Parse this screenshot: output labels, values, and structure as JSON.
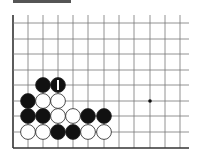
{
  "board": {
    "grid_origin_x": 13,
    "grid_top_y": 15,
    "col_x": [
      13,
      28,
      43,
      58,
      73,
      88,
      104,
      119,
      134,
      150,
      165,
      180
    ],
    "row_y": [
      23,
      39,
      54,
      70,
      85,
      101,
      116,
      132,
      148
    ],
    "right_edge_x": 189,
    "bottom_edge_y": 148,
    "stone_radius": 7.4,
    "line_color": "#777777",
    "edge_color": "#333333",
    "star_points": [
      {
        "c": 9,
        "r": 5
      }
    ],
    "stones": [
      {
        "c": 2,
        "r": 4,
        "color": "black"
      },
      {
        "c": 3,
        "r": 4,
        "color": "black",
        "mark": "1"
      },
      {
        "c": 1,
        "r": 5,
        "color": "black"
      },
      {
        "c": 2,
        "r": 5,
        "color": "white"
      },
      {
        "c": 3,
        "r": 5,
        "color": "white"
      },
      {
        "c": 1,
        "r": 6,
        "color": "black"
      },
      {
        "c": 2,
        "r": 6,
        "color": "black"
      },
      {
        "c": 3,
        "r": 6,
        "color": "white"
      },
      {
        "c": 4,
        "r": 6,
        "color": "white"
      },
      {
        "c": 5,
        "r": 6,
        "color": "black"
      },
      {
        "c": 6,
        "r": 6,
        "color": "black"
      },
      {
        "c": 1,
        "r": 7,
        "color": "white"
      },
      {
        "c": 2,
        "r": 7,
        "color": "white"
      },
      {
        "c": 3,
        "r": 7,
        "color": "black"
      },
      {
        "c": 4,
        "r": 7,
        "color": "black"
      },
      {
        "c": 5,
        "r": 7,
        "color": "white"
      },
      {
        "c": 6,
        "r": 7,
        "color": "white"
      }
    ]
  }
}
